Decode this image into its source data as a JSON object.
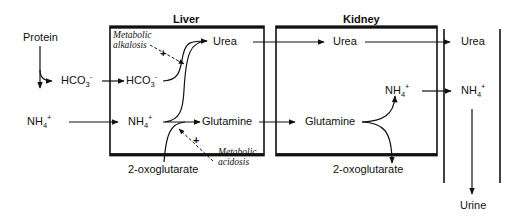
{
  "compartments": {
    "liver": {
      "title": "Liver"
    },
    "kidney": {
      "title": "Kidney"
    },
    "urine": {
      "title": "Urine"
    }
  },
  "molecules": {
    "protein": "Protein",
    "hco3_base": "HCO",
    "hco3_sub": "3",
    "hco3_sup": "-",
    "nh4_base": "NH",
    "nh4_sub": "4",
    "nh4_sup": "+",
    "urea": "Urea",
    "glutamine": "Glutamine",
    "oxoglutarate": "2-oxoglutarate"
  },
  "modulators": {
    "alkalosis_line1": "Metabolic",
    "alkalosis_line2": "alkalosis",
    "acidosis_line1": "Metabolic",
    "acidosis_line2": "acidosis",
    "plus": "+"
  },
  "colors": {
    "stroke": "#111111",
    "background": "#ffffff"
  }
}
